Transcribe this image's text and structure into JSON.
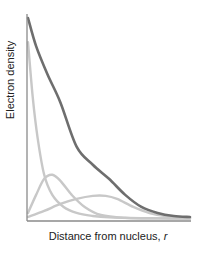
{
  "chart_data": {
    "type": "line",
    "title": "",
    "xlabel": "Distance from nucleus, r",
    "xlabel_main": "Distance from nucleus, ",
    "xlabel_var": "r",
    "ylabel": "Electron density",
    "grid": false,
    "legend": null,
    "axis_ranges": {
      "x": [
        0,
        1
      ],
      "y": [
        0,
        1
      ]
    },
    "series": [
      {
        "name": "total electron density",
        "color": "#6e6e6e",
        "width": 2.6,
        "x": [
          0.0,
          0.05,
          0.12,
          0.2,
          0.3,
          0.4,
          0.5,
          0.6,
          0.7,
          0.8,
          0.9,
          1.0
        ],
        "y": [
          1.0,
          0.86,
          0.72,
          0.58,
          0.36,
          0.27,
          0.2,
          0.12,
          0.06,
          0.03,
          0.015,
          0.01
        ]
      },
      {
        "name": "inner shell component",
        "color": "#c8c8c8",
        "width": 2.4,
        "x": [
          0.0,
          0.03,
          0.06,
          0.1,
          0.15,
          0.22,
          0.3,
          0.4,
          0.5,
          0.7,
          1.0
        ],
        "y": [
          0.88,
          0.6,
          0.4,
          0.22,
          0.12,
          0.06,
          0.03,
          0.015,
          0.008,
          0.004,
          0.002
        ]
      },
      {
        "name": "second shell component",
        "color": "#c8c8c8",
        "width": 2.4,
        "x": [
          0.0,
          0.05,
          0.1,
          0.15,
          0.2,
          0.27,
          0.35,
          0.45,
          0.6,
          0.8,
          1.0
        ],
        "y": [
          0.03,
          0.12,
          0.2,
          0.22,
          0.19,
          0.12,
          0.06,
          0.02,
          0.006,
          0.003,
          0.002
        ]
      },
      {
        "name": "third shell component",
        "color": "#c8c8c8",
        "width": 2.4,
        "x": [
          0.0,
          0.1,
          0.2,
          0.3,
          0.4,
          0.48,
          0.55,
          0.65,
          0.75,
          0.85,
          1.0
        ],
        "y": [
          0.01,
          0.04,
          0.075,
          0.1,
          0.115,
          0.115,
          0.1,
          0.06,
          0.03,
          0.015,
          0.006
        ]
      }
    ]
  },
  "colors": {
    "axis": "#8a8a8a",
    "total_curve": "#6e6e6e",
    "component_curve": "#c8c8c8",
    "text": "#222222"
  }
}
